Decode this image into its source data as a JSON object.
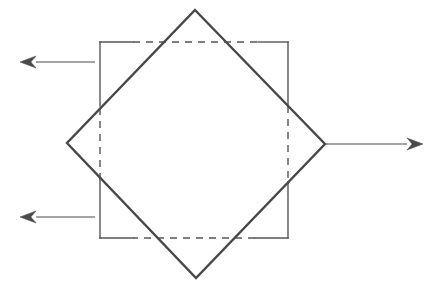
{
  "figure": {
    "canvas": {
      "width": 442,
      "height": 296,
      "background": "#ffffff"
    },
    "ink_color": "#4a4a4a",
    "ink_color_dark": "#3b3b3b"
  },
  "shapes": {
    "square": {
      "name": "axis-aligned-square",
      "left": 100,
      "right": 288,
      "top": 42,
      "bottom": 238,
      "stroke": "#555555",
      "stroke_width": 1.4,
      "line_style_outside": "solid",
      "line_style_inside": "dashed",
      "dash_pattern": "7 6",
      "segments_solid": [
        {
          "name": "top-left-solid",
          "x1": 100,
          "y1": 42,
          "x2": 133,
          "y2": 42
        },
        {
          "name": "top-right-solid",
          "x1": 258,
          "y1": 42,
          "x2": 288,
          "y2": 42
        },
        {
          "name": "right-top-solid",
          "x1": 288,
          "y1": 42,
          "x2": 288,
          "y2": 106
        },
        {
          "name": "right-bottom-solid",
          "x1": 288,
          "y1": 182,
          "x2": 288,
          "y2": 238
        },
        {
          "name": "bottom-right-solid",
          "x1": 288,
          "y1": 238,
          "x2": 255,
          "y2": 238
        },
        {
          "name": "bottom-left-solid",
          "x1": 133,
          "y1": 238,
          "x2": 100,
          "y2": 238
        },
        {
          "name": "left-bottom-solid",
          "x1": 100,
          "y1": 238,
          "x2": 100,
          "y2": 180
        },
        {
          "name": "left-top-solid",
          "x1": 100,
          "y1": 106,
          "x2": 100,
          "y2": 42
        }
      ],
      "segments_dashed": [
        {
          "name": "top-dashed",
          "x1": 133,
          "y1": 42,
          "x2": 258,
          "y2": 42
        },
        {
          "name": "right-dashed",
          "x1": 288,
          "y1": 106,
          "x2": 288,
          "y2": 182
        },
        {
          "name": "bottom-dashed",
          "x1": 255,
          "y1": 238,
          "x2": 133,
          "y2": 238
        },
        {
          "name": "left-dashed",
          "x1": 100,
          "y1": 180,
          "x2": 100,
          "y2": 106
        }
      ]
    },
    "diamond": {
      "name": "rotated-square",
      "stroke": "#484848",
      "stroke_width": 2.4,
      "line_style": "solid",
      "vertices": [
        {
          "name": "top-vertex",
          "x": 195,
          "y": 10
        },
        {
          "name": "right-vertex",
          "x": 325,
          "y": 144
        },
        {
          "name": "bottom-vertex",
          "x": 196,
          "y": 278
        },
        {
          "name": "left-vertex",
          "x": 67,
          "y": 143
        }
      ],
      "points": "195,10 325,144 196,278 67,143"
    }
  },
  "arrows": [
    {
      "name": "arrow-upper-left",
      "direction": "left",
      "tail_x": 95,
      "tail_y": 62,
      "tip_x": 20,
      "tip_y": 62,
      "shaft_width": 1.0,
      "head_length": 16,
      "head_half_width": 6,
      "stroke": "#4a4a4a"
    },
    {
      "name": "arrow-lower-left",
      "direction": "left",
      "tail_x": 95,
      "tail_y": 217,
      "tip_x": 20,
      "tip_y": 217,
      "shaft_width": 1.2,
      "head_length": 16,
      "head_half_width": 6,
      "stroke": "#4a4a4a"
    },
    {
      "name": "arrow-right",
      "direction": "right",
      "tail_x": 325,
      "tail_y": 144,
      "tip_x": 423,
      "tip_y": 144,
      "shaft_width": 1.1,
      "head_length": 16,
      "head_half_width": 6,
      "stroke": "#4a4a4a"
    }
  ]
}
